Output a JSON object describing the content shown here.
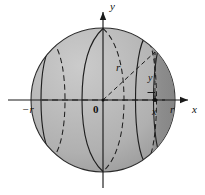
{
  "axes": {
    "y_axis_label": "y",
    "x_axis_label": "x",
    "origin_label": "0",
    "left_tick_label": "−r",
    "right_tick_label": "r"
  },
  "annotations": {
    "radius_label": "r",
    "disk_radius_label": "y",
    "slab_position_label": "x"
  },
  "colors": {
    "background": "#ffffff",
    "sphere_fill": "#b2b2b2",
    "sphere_highlight": "#c4c4c4",
    "sphere_shadow": "#a0a0a0",
    "slab_fill": "#8e8e8e",
    "outline": "#1a1a1a",
    "axis": "#1a1a1a",
    "text": "#111111"
  },
  "geometry": {
    "sphere_center_x": 103,
    "sphere_center_y": 100,
    "sphere_radius": 72,
    "slab_left_x": 146,
    "slab_right_x": 164,
    "point_x": 155,
    "point_y": 100
  }
}
